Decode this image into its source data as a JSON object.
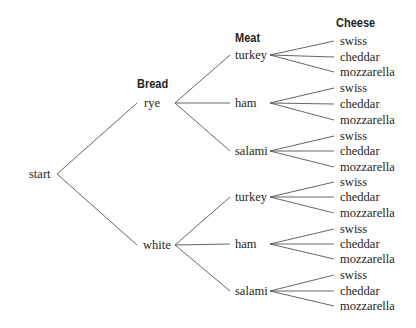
{
  "diagram": {
    "type": "tree-diagram",
    "headers": {
      "bread": "Bread",
      "meat": "Meat",
      "cheese": "Cheese"
    },
    "root": "start",
    "breads": [
      {
        "label": "rye",
        "meats": [
          "turkey",
          "ham",
          "salami"
        ]
      },
      {
        "label": "white",
        "meats": [
          "turkey",
          "ham",
          "salami"
        ]
      }
    ],
    "cheeses": [
      "swiss",
      "cheddar",
      "mozzarella"
    ],
    "labels": {
      "root": "start",
      "bread_0": "rye",
      "bread_1": "white",
      "meat_0": "turkey",
      "meat_1": "ham",
      "meat_2": "salami",
      "meat_3": "turkey",
      "meat_4": "ham",
      "meat_5": "salami",
      "cheese_0": "swiss",
      "cheese_1": "cheddar",
      "cheese_2": "mozzarella",
      "cheese_3": "swiss",
      "cheese_4": "cheddar",
      "cheese_5": "mozzarella",
      "cheese_6": "swiss",
      "cheese_7": "cheddar",
      "cheese_8": "mozzarella",
      "cheese_9": "swiss",
      "cheese_10": "cheddar",
      "cheese_11": "mozzarella",
      "cheese_12": "swiss",
      "cheese_13": "cheddar",
      "cheese_14": "mozzarella",
      "cheese_15": "swiss",
      "cheese_16": "cheddar",
      "cheese_17": "mozzarella"
    },
    "line_color": "#555555",
    "text_color": "#231f20"
  }
}
